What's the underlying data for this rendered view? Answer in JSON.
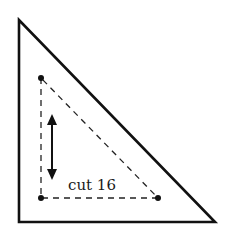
{
  "diagram": {
    "type": "quilt-template",
    "shape": "right-triangle",
    "cut_label": "cut 16",
    "grain_arrow": "vertical double-headed arrow",
    "outer_triangle": {
      "points": [
        [
          19,
          20
        ],
        [
          19,
          222
        ],
        [
          215,
          222
        ]
      ]
    },
    "inner_triangle": {
      "points": [
        [
          41,
          78
        ],
        [
          41,
          198
        ],
        [
          158,
          198
        ]
      ],
      "style": "dashed"
    },
    "colors": {
      "stroke": "#111111",
      "background": "#ffffff"
    }
  }
}
